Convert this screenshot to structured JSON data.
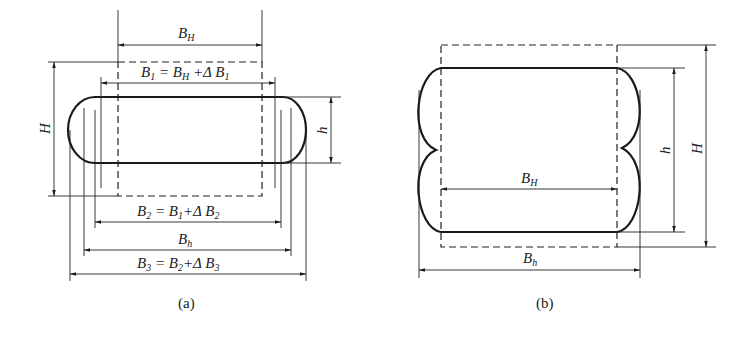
{
  "figure_a": {
    "caption": "(a)",
    "labels": {
      "BH": {
        "main": "B",
        "sub": "H",
        "rest": ""
      },
      "B1": {
        "text": "B",
        "sub1": "1",
        "eq": " = B",
        "sub2": "H",
        "plus": " +Δ B",
        "sub3": "1"
      },
      "B2": {
        "text": "B",
        "sub1": "2",
        "eq": " = B",
        "sub2": "1",
        "plus": "+Δ B",
        "sub3": "2"
      },
      "Bh": {
        "main": "B",
        "sub": "h"
      },
      "B3": {
        "text": "B",
        "sub1": "3",
        "eq": " = B",
        "sub2": "2",
        "plus": "+Δ B",
        "sub3": "3"
      },
      "H": "H",
      "h": "h"
    }
  },
  "figure_b": {
    "caption": "(b)",
    "labels": {
      "BH": {
        "main": "B",
        "sub": "H"
      },
      "Bh": {
        "main": "B",
        "sub": "h"
      },
      "h": "h",
      "H": "H"
    }
  }
}
